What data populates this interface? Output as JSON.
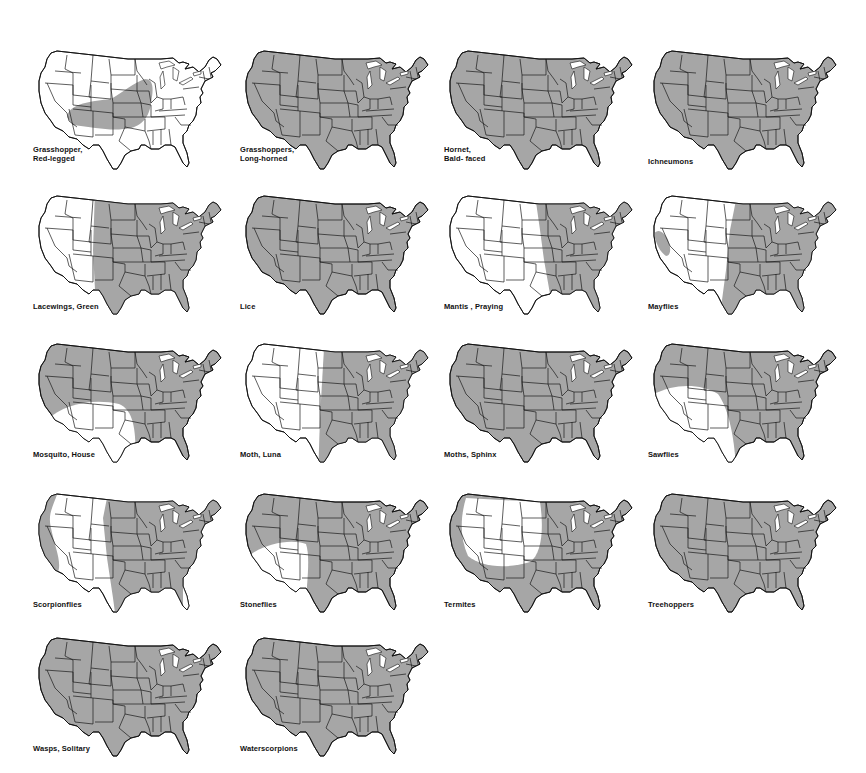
{
  "page": {
    "title": "",
    "shade_color": "#a6a6a6",
    "line_color": "#1a1a1a",
    "background": "#ffffff"
  },
  "maps": [
    {
      "id": "grasshopper-red-legged",
      "label_lines": [
        "Grasshopper,",
        "Red-legged"
      ],
      "range": "central-band"
    },
    {
      "id": "grasshoppers-long-horned",
      "label_lines": [
        "Grasshoppers,",
        "Long-horned"
      ],
      "range": "full"
    },
    {
      "id": "hornet-bald-faced",
      "label_lines": [
        "Hornet,",
        "Bald- faced"
      ],
      "range": "full"
    },
    {
      "id": "ichneumons",
      "label_lines": [
        "Ichneumons"
      ],
      "range": "full"
    },
    {
      "id": "lacewings-green",
      "label_lines": [
        "Lacewings, Green"
      ],
      "range": "east-of-rockies"
    },
    {
      "id": "lice",
      "label_lines": [
        "Lice"
      ],
      "range": "full"
    },
    {
      "id": "mantis-praying",
      "label_lines": [
        "Mantis , Praying"
      ],
      "range": "east-of-plains"
    },
    {
      "id": "mayflies",
      "label_lines": [
        "Mayflies"
      ],
      "range": "east-plus-ca"
    },
    {
      "id": "mosquito-house",
      "label_lines": [
        "Mosquito, House"
      ],
      "range": "except-southwest"
    },
    {
      "id": "moth-luna",
      "label_lines": [
        "Moth, Luna"
      ],
      "range": "east-of-plains-tx"
    },
    {
      "id": "moths-sphinx",
      "label_lines": [
        "Moths, Sphinx"
      ],
      "range": "full"
    },
    {
      "id": "sawflies",
      "label_lines": [
        "Sawflies"
      ],
      "range": "except-sw-arc"
    },
    {
      "id": "scorpionflies",
      "label_lines": [
        "Scorpionflies"
      ],
      "range": "east-plus-pacific"
    },
    {
      "id": "stoneflies",
      "label_lines": [
        "Stoneflies"
      ],
      "range": "except-sw-small"
    },
    {
      "id": "termites",
      "label_lines": [
        "Termites"
      ],
      "range": "except-interior-west"
    },
    {
      "id": "treehoppers",
      "label_lines": [
        "Treehoppers"
      ],
      "range": "full"
    },
    {
      "id": "wasps-solitary",
      "label_lines": [
        "Wasps, Solitary"
      ],
      "range": "full"
    },
    {
      "id": "waterscorpions",
      "label_lines": [
        "Waterscorpions"
      ],
      "range": "full"
    }
  ],
  "labels": {
    "m0": "Grasshopper,\nRed-legged",
    "m1": "Grasshoppers,\nLong-horned",
    "m2": "Hornet,\nBald- faced",
    "m3": "Ichneumons",
    "m4": "Lacewings, Green",
    "m5": "Lice",
    "m6": "Mantis , Praying",
    "m7": "Mayflies",
    "m8": "Mosquito, House",
    "m9": "Moth, Luna",
    "m10": "Moths, Sphinx",
    "m11": "Sawflies",
    "m12": "Scorpionflies",
    "m13": "Stoneflies",
    "m14": "Termites",
    "m15": "Treehoppers",
    "m16": "Wasps, Solitary",
    "m17": "Waterscorpions"
  }
}
